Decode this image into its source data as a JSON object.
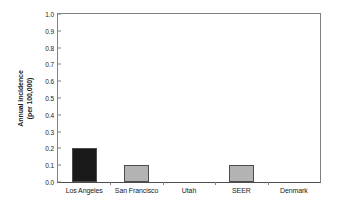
{
  "chart_data": {
    "type": "bar",
    "title": "",
    "subtitle": "",
    "xlabel": "",
    "ylabel": "Annual incidence\n(per 100,000)",
    "ylabel_lines": [
      "Annual incidence",
      "(per 100,000)"
    ],
    "categories": [
      "Los Angeles",
      "San Francisco",
      "Utah",
      "SEER",
      "Denmark"
    ],
    "values": [
      0.2,
      0.1,
      0.0,
      0.1,
      0.0
    ],
    "bar_colors": [
      "#1a1a1a",
      "#b3b3b3",
      "#b3b3b3",
      "#b3b3b3",
      "#b3b3b3"
    ],
    "ylim": [
      0.0,
      1.0
    ],
    "ytick_values": [
      1.0,
      0.9,
      0.8,
      0.7,
      0.6,
      0.5,
      0.4,
      0.3,
      0.2,
      0.1,
      0.0
    ],
    "ytick_labels": [
      "1.0",
      "0.9",
      "0.8",
      "0.7",
      "0.6",
      "0.5",
      "0.4",
      "0.3",
      "0.2",
      "0.1",
      "0.0"
    ],
    "grid": false,
    "legend": null,
    "legend_position": "none",
    "axis_color": "#808080",
    "text_color": "#1a1a1a",
    "background": "#ffffff"
  }
}
